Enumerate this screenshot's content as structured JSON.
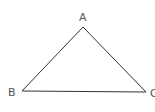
{
  "diagram": {
    "type": "triangle",
    "stroke_color": "#333333",
    "label_color": "#555555",
    "vertices": [
      {
        "name": "A",
        "x": 83,
        "y": 27,
        "label_x": 79,
        "label_y": 21
      },
      {
        "name": "B",
        "x": 22,
        "y": 91,
        "label_x": 8,
        "label_y": 96
      },
      {
        "name": "C",
        "x": 146,
        "y": 92,
        "label_x": 150,
        "label_y": 97
      }
    ],
    "edges": [
      [
        "A",
        "B"
      ],
      [
        "B",
        "C"
      ],
      [
        "C",
        "A"
      ]
    ]
  }
}
